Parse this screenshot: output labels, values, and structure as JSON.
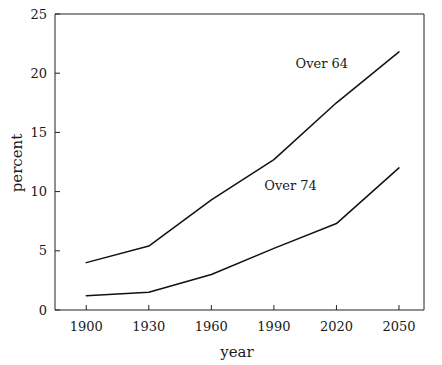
{
  "chart_data": {
    "type": "line",
    "title": "",
    "xlabel": "year",
    "ylabel": "percent",
    "x": [
      1900,
      1930,
      1960,
      1990,
      2020,
      2050
    ],
    "xticklabels": [
      "1900",
      "1930",
      "1960",
      "1990",
      "2020",
      "2050"
    ],
    "yticklabels": [
      "0",
      "5",
      "10",
      "15",
      "20",
      "25"
    ],
    "yticks": [
      0,
      5,
      10,
      15,
      20,
      25
    ],
    "xlim": [
      1885,
      2062
    ],
    "ylim": [
      0,
      25
    ],
    "grid": false,
    "legend_position": "inline-annotation",
    "series": [
      {
        "name": "Over 64",
        "values": [
          4.0,
          5.4,
          9.3,
          12.7,
          17.5,
          21.8
        ],
        "annotation": "Over 64",
        "annotation_x": 2013,
        "annotation_y": 20.4,
        "color": "#111111"
      },
      {
        "name": "Over 74",
        "values": [
          1.2,
          1.5,
          3.0,
          5.2,
          7.3,
          12.0
        ],
        "annotation": "Over 74",
        "annotation_x": 1998,
        "annotation_y": 10.1,
        "color": "#111111"
      }
    ]
  }
}
